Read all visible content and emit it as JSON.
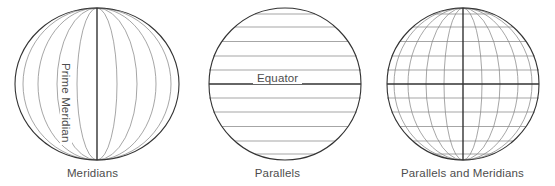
{
  "figure": {
    "background_color": "#ffffff",
    "width": 555,
    "height": 186
  },
  "style": {
    "grid_line_color": "#808080",
    "outline_color": "#333333",
    "emphasis_line_color": "#333333",
    "text_color": "#4d4d4d",
    "grid_line_width": 0.7,
    "outline_width": 1.1,
    "emphasis_line_width": 1.4
  },
  "panels": [
    {
      "id": "meridians",
      "caption": "Meridians",
      "inline_label": "Prime Meridian",
      "center": {
        "cx": 97,
        "cy": 84
      },
      "radius": {
        "rx": 82,
        "ry": 76
      },
      "meridian_count": 11,
      "parallel_count": 0,
      "emphasized": "prime-meridian",
      "meridian_half_widths": [
        82,
        74,
        59,
        40,
        20,
        0,
        20,
        40,
        59,
        74,
        82
      ]
    },
    {
      "id": "parallels",
      "caption": "Parallels",
      "inline_label": "Equator",
      "center": {
        "cx": 285,
        "cy": 84
      },
      "radius": {
        "rx": 76,
        "ry": 76
      },
      "meridian_count": 0,
      "parallel_count": 11,
      "emphasized": "equator",
      "parallel_offsets": [
        -70,
        -57,
        -42.5,
        -28,
        -14,
        0,
        14,
        28,
        42.5,
        57,
        70
      ]
    },
    {
      "id": "parallels-and-meridians",
      "caption": "Parallels and Meridians",
      "inline_label": "",
      "center": {
        "cx": 463,
        "cy": 84
      },
      "radius": {
        "rx": 76,
        "ry": 76
      },
      "meridian_count": 11,
      "parallel_count": 11,
      "emphasized": "both",
      "meridian_half_widths": [
        76,
        69,
        55,
        37,
        19,
        0,
        19,
        37,
        55,
        69,
        76
      ],
      "parallel_offsets": [
        -70,
        -57,
        -42.5,
        -28,
        -14,
        0,
        14,
        28,
        42.5,
        57,
        70
      ]
    }
  ]
}
